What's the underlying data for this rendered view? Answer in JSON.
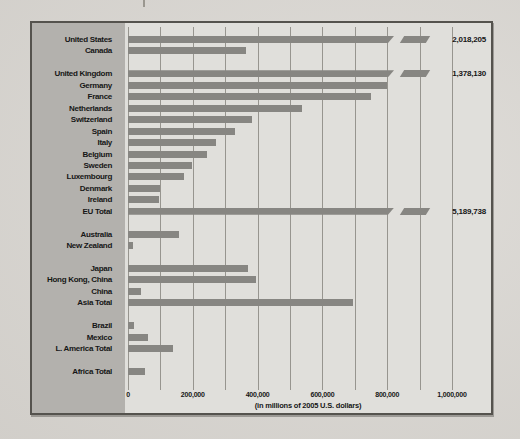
{
  "colors": {
    "page_bg": "#d8d5d0",
    "panel_bg": "#b3b1ad",
    "plot_bg": "#e0dfdb",
    "bar": "#878682",
    "gridline": "#97958f",
    "frame": "#55534e",
    "text": "#161616"
  },
  "chart_data": {
    "type": "bar",
    "orientation": "horizontal",
    "title": "",
    "xlabel": "(in millions of 2005 U.S. dollars)",
    "ylabel": "",
    "xlim": [
      0,
      1000000
    ],
    "gridline_interval": 100000,
    "grid": true,
    "x_ticks": [
      0,
      200000,
      400000,
      600000,
      800000,
      1000000
    ],
    "x_tick_labels": [
      "0",
      "200,000",
      "400,000",
      "600,000",
      "800,000",
      "1,000,000"
    ],
    "axis_break_note": "Bars for United States, United Kingdom and EU Total exceed the axis and are drawn with a break; exact values printed at right",
    "categories": [
      "United States",
      "Canada",
      "United Kingdom",
      "Germany",
      "France",
      "Netherlands",
      "Switzerland",
      "Spain",
      "Italy",
      "Belgium",
      "Sweden",
      "Luxembourg",
      "Denmark",
      "Ireland",
      "EU Total",
      "Australia",
      "New Zealand",
      "Japan",
      "Hong Kong, China",
      "China",
      "Asia Total",
      "Brazil",
      "Mexico",
      "L. America Total",
      "Africa Total"
    ],
    "values": [
      2018205,
      364000,
      1378130,
      799000,
      749000,
      536000,
      382000,
      331000,
      273000,
      245000,
      197000,
      172000,
      98000,
      95000,
      5189738,
      156000,
      14000,
      369000,
      394000,
      41000,
      693000,
      18000,
      63000,
      139000,
      54000
    ],
    "groups": [
      {
        "rows": [
          {
            "label": "United States",
            "value": 2018205,
            "value_label": "2,018,205",
            "overflow": true
          },
          {
            "label": "Canada",
            "value": 364000,
            "overflow": false
          }
        ]
      },
      {
        "rows": [
          {
            "label": "United Kingdom",
            "value": 1378130,
            "value_label": "1,378,130",
            "overflow": true
          },
          {
            "label": "Germany",
            "value": 799000,
            "overflow": false
          },
          {
            "label": "France",
            "value": 749000,
            "overflow": false
          },
          {
            "label": "Netherlands",
            "value": 536000,
            "overflow": false
          },
          {
            "label": "Switzerland",
            "value": 382000,
            "overflow": false
          },
          {
            "label": "Spain",
            "value": 331000,
            "overflow": false
          },
          {
            "label": "Italy",
            "value": 273000,
            "overflow": false
          },
          {
            "label": "Belgium",
            "value": 245000,
            "overflow": false
          },
          {
            "label": "Sweden",
            "value": 197000,
            "overflow": false
          },
          {
            "label": "Luxembourg",
            "value": 172000,
            "overflow": false
          },
          {
            "label": "Denmark",
            "value": 98000,
            "overflow": false
          },
          {
            "label": "Ireland",
            "value": 95000,
            "overflow": false
          },
          {
            "label": "EU Total",
            "value": 5189738,
            "value_label": "5,189,738",
            "overflow": true
          }
        ]
      },
      {
        "rows": [
          {
            "label": "Australia",
            "value": 156000,
            "overflow": false
          },
          {
            "label": "New Zealand",
            "value": 14000,
            "overflow": false
          }
        ]
      },
      {
        "rows": [
          {
            "label": "Japan",
            "value": 369000,
            "overflow": false
          },
          {
            "label": "Hong Kong, China",
            "value": 394000,
            "overflow": false
          },
          {
            "label": "China",
            "value": 41000,
            "overflow": false
          },
          {
            "label": "Asia Total",
            "value": 693000,
            "overflow": false
          }
        ]
      },
      {
        "rows": [
          {
            "label": "Brazil",
            "value": 18000,
            "overflow": false
          },
          {
            "label": "Mexico",
            "value": 63000,
            "overflow": false
          },
          {
            "label": "L. America Total",
            "value": 139000,
            "overflow": false
          }
        ]
      },
      {
        "rows": [
          {
            "label": "Africa Total",
            "value": 54000,
            "overflow": false
          }
        ]
      }
    ]
  }
}
